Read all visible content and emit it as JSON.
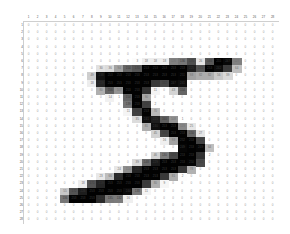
{
  "grid": {
    "rows": 28,
    "cols": 28,
    "col_headers": [
      "1",
      "2",
      "3",
      "4",
      "5",
      "6",
      "7",
      "8",
      "9",
      "10",
      "11",
      "12",
      "13",
      "14",
      "15",
      "16",
      "17",
      "18",
      "19",
      "20",
      "21",
      "22",
      "23",
      "24",
      "25",
      "26",
      "27",
      "28"
    ],
    "row_headers": [
      "1",
      "2",
      "3",
      "4",
      "5",
      "6",
      "7",
      "8",
      "9",
      "10",
      "11",
      "12",
      "13",
      "14",
      "15",
      "16",
      "17",
      "18",
      "19",
      "20",
      "21",
      "22",
      "23",
      "24",
      "25",
      "26",
      "27",
      "28"
    ],
    "pixels": [
      [
        0,
        0,
        0,
        0,
        0,
        0,
        0,
        0,
        0,
        0,
        0,
        0,
        0,
        0,
        0,
        0,
        0,
        0,
        0,
        0,
        0,
        0,
        0,
        0,
        0,
        0,
        0,
        0
      ],
      [
        0,
        0,
        0,
        0,
        0,
        0,
        0,
        0,
        0,
        0,
        0,
        0,
        0,
        0,
        0,
        0,
        0,
        0,
        0,
        0,
        0,
        0,
        0,
        0,
        0,
        0,
        0,
        0
      ],
      [
        0,
        0,
        0,
        0,
        0,
        0,
        0,
        0,
        0,
        0,
        0,
        0,
        0,
        0,
        0,
        0,
        0,
        0,
        0,
        0,
        0,
        0,
        0,
        0,
        0,
        0,
        0,
        0
      ],
      [
        0,
        0,
        0,
        0,
        0,
        0,
        0,
        0,
        0,
        0,
        0,
        0,
        0,
        0,
        0,
        0,
        0,
        0,
        0,
        0,
        0,
        0,
        0,
        0,
        0,
        0,
        0,
        0
      ],
      [
        0,
        0,
        0,
        0,
        0,
        0,
        0,
        0,
        0,
        0,
        0,
        0,
        0,
        0,
        0,
        0,
        0,
        0,
        0,
        0,
        0,
        0,
        0,
        0,
        0,
        0,
        0,
        0
      ],
      [
        0,
        0,
        0,
        0,
        0,
        0,
        0,
        0,
        0,
        0,
        0,
        0,
        3,
        18,
        18,
        18,
        126,
        136,
        175,
        26,
        166,
        255,
        247,
        127,
        0,
        0,
        0,
        0
      ],
      [
        0,
        0,
        0,
        0,
        0,
        0,
        0,
        0,
        30,
        36,
        94,
        154,
        170,
        253,
        253,
        253,
        253,
        253,
        225,
        172,
        253,
        242,
        195,
        64,
        0,
        0,
        0,
        0
      ],
      [
        0,
        0,
        0,
        0,
        0,
        0,
        0,
        49,
        238,
        253,
        253,
        253,
        253,
        253,
        253,
        253,
        253,
        251,
        93,
        82,
        82,
        56,
        39,
        0,
        0,
        0,
        0,
        0
      ],
      [
        0,
        0,
        0,
        0,
        0,
        0,
        0,
        18,
        219,
        253,
        253,
        253,
        253,
        253,
        198,
        182,
        247,
        241,
        0,
        0,
        0,
        0,
        0,
        0,
        0,
        0,
        0,
        0
      ],
      [
        0,
        0,
        0,
        0,
        0,
        0,
        0,
        0,
        80,
        156,
        107,
        253,
        253,
        205,
        11,
        0,
        43,
        154,
        0,
        0,
        0,
        0,
        0,
        0,
        0,
        0,
        0,
        0
      ],
      [
        0,
        0,
        0,
        0,
        0,
        0,
        0,
        0,
        0,
        14,
        1,
        154,
        253,
        90,
        0,
        0,
        0,
        0,
        0,
        0,
        0,
        0,
        0,
        0,
        0,
        0,
        0,
        0
      ],
      [
        0,
        0,
        0,
        0,
        0,
        0,
        0,
        0,
        0,
        0,
        0,
        139,
        253,
        190,
        2,
        0,
        0,
        0,
        0,
        0,
        0,
        0,
        0,
        0,
        0,
        0,
        0,
        0
      ],
      [
        0,
        0,
        0,
        0,
        0,
        0,
        0,
        0,
        0,
        0,
        0,
        11,
        190,
        253,
        70,
        0,
        0,
        0,
        0,
        0,
        0,
        0,
        0,
        0,
        0,
        0,
        0,
        0
      ],
      [
        0,
        0,
        0,
        0,
        0,
        0,
        0,
        0,
        0,
        0,
        0,
        0,
        35,
        241,
        225,
        160,
        108,
        1,
        0,
        0,
        0,
        0,
        0,
        0,
        0,
        0,
        0,
        0
      ],
      [
        0,
        0,
        0,
        0,
        0,
        0,
        0,
        0,
        0,
        0,
        0,
        0,
        0,
        81,
        240,
        253,
        253,
        119,
        25,
        0,
        0,
        0,
        0,
        0,
        0,
        0,
        0,
        0
      ],
      [
        0,
        0,
        0,
        0,
        0,
        0,
        0,
        0,
        0,
        0,
        0,
        0,
        0,
        0,
        45,
        186,
        253,
        253,
        150,
        27,
        0,
        0,
        0,
        0,
        0,
        0,
        0,
        0
      ],
      [
        0,
        0,
        0,
        0,
        0,
        0,
        0,
        0,
        0,
        0,
        0,
        0,
        0,
        0,
        0,
        16,
        93,
        252,
        253,
        187,
        0,
        0,
        0,
        0,
        0,
        0,
        0,
        0
      ],
      [
        0,
        0,
        0,
        0,
        0,
        0,
        0,
        0,
        0,
        0,
        0,
        0,
        0,
        0,
        0,
        0,
        0,
        249,
        253,
        249,
        64,
        0,
        0,
        0,
        0,
        0,
        0,
        0
      ],
      [
        0,
        0,
        0,
        0,
        0,
        0,
        0,
        0,
        0,
        0,
        0,
        0,
        0,
        0,
        46,
        130,
        183,
        253,
        253,
        207,
        2,
        0,
        0,
        0,
        0,
        0,
        0,
        0
      ],
      [
        0,
        0,
        0,
        0,
        0,
        0,
        0,
        0,
        0,
        0,
        0,
        0,
        39,
        148,
        229,
        253,
        253,
        253,
        250,
        182,
        0,
        0,
        0,
        0,
        0,
        0,
        0,
        0
      ],
      [
        0,
        0,
        0,
        0,
        0,
        0,
        0,
        0,
        0,
        0,
        24,
        114,
        221,
        253,
        253,
        253,
        253,
        201,
        78,
        0,
        0,
        0,
        0,
        0,
        0,
        0,
        0,
        0
      ],
      [
        0,
        0,
        0,
        0,
        0,
        0,
        0,
        0,
        23,
        66,
        213,
        253,
        253,
        253,
        253,
        198,
        81,
        2,
        0,
        0,
        0,
        0,
        0,
        0,
        0,
        0,
        0,
        0
      ],
      [
        0,
        0,
        0,
        0,
        0,
        0,
        18,
        171,
        219,
        253,
        253,
        253,
        253,
        195,
        80,
        9,
        0,
        0,
        0,
        0,
        0,
        0,
        0,
        0,
        0,
        0,
        0,
        0
      ],
      [
        0,
        0,
        0,
        0,
        55,
        172,
        226,
        253,
        253,
        253,
        253,
        244,
        133,
        11,
        0,
        0,
        0,
        0,
        0,
        0,
        0,
        0,
        0,
        0,
        0,
        0,
        0,
        0
      ],
      [
        0,
        0,
        0,
        0,
        136,
        253,
        253,
        253,
        212,
        135,
        132,
        16,
        0,
        0,
        0,
        0,
        0,
        0,
        0,
        0,
        0,
        0,
        0,
        0,
        0,
        0,
        0,
        0
      ],
      [
        0,
        0,
        0,
        0,
        0,
        0,
        0,
        0,
        0,
        0,
        0,
        0,
        0,
        0,
        0,
        0,
        0,
        0,
        0,
        0,
        0,
        0,
        0,
        0,
        0,
        0,
        0,
        0
      ],
      [
        0,
        0,
        0,
        0,
        0,
        0,
        0,
        0,
        0,
        0,
        0,
        0,
        0,
        0,
        0,
        0,
        0,
        0,
        0,
        0,
        0,
        0,
        0,
        0,
        0,
        0,
        0,
        0
      ],
      [
        0,
        0,
        0,
        0,
        0,
        0,
        0,
        0,
        0,
        0,
        0,
        0,
        0,
        0,
        0,
        0,
        0,
        0,
        0,
        0,
        0,
        0,
        0,
        0,
        0,
        0,
        0,
        0
      ]
    ]
  },
  "colors": {
    "ink": "#000000",
    "paper": "#ffffff",
    "zero_text": "#9a9a9a",
    "gridline": "#cfcfcf"
  }
}
